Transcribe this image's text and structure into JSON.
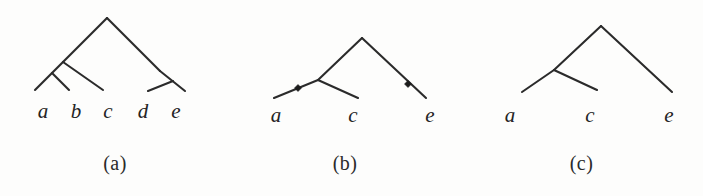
{
  "figure": {
    "background_color": "#fdfdfc",
    "line_color": "#2b2b2b",
    "marker_color": "#1c1c1c",
    "label_color": "#242424"
  },
  "panels": [
    {
      "id": "a",
      "caption": "(a)",
      "leaves": [
        {
          "label": "a",
          "x": 43,
          "y": 118
        },
        {
          "label": "b",
          "x": 76,
          "y": 118
        },
        {
          "label": "c",
          "x": 108,
          "y": 118
        },
        {
          "label": "d",
          "x": 143,
          "y": 118
        },
        {
          "label": "e",
          "x": 176,
          "y": 118
        }
      ],
      "edges": [
        {
          "name": "root-left",
          "x1": 107,
          "y1": 18,
          "x2": 63,
          "y2": 62
        },
        {
          "name": "root-right",
          "x1": 107,
          "y1": 18,
          "x2": 160,
          "y2": 71
        },
        {
          "name": "ab-stem",
          "x1": 63,
          "y1": 62,
          "x2": 35,
          "y2": 90
        },
        {
          "name": "b-branch",
          "x1": 52,
          "y1": 73,
          "x2": 69,
          "y2": 90
        },
        {
          "name": "c-branch",
          "x1": 63,
          "y1": 62,
          "x2": 103,
          "y2": 90
        },
        {
          "name": "de-stem",
          "x1": 160,
          "y1": 71,
          "x2": 185,
          "y2": 91
        },
        {
          "name": "d-branch",
          "x1": 173,
          "y1": 81,
          "x2": 148,
          "y2": 91
        }
      ],
      "markers": []
    },
    {
      "id": "b",
      "caption": "(b)",
      "leaves": [
        {
          "label": "a",
          "x": 46,
          "y": 122
        },
        {
          "label": "c",
          "x": 123,
          "y": 122
        },
        {
          "label": "e",
          "x": 200,
          "y": 122
        }
      ],
      "edges": [
        {
          "name": "root-left",
          "x1": 132,
          "y1": 38,
          "x2": 88,
          "y2": 80
        },
        {
          "name": "root-right",
          "x1": 132,
          "y1": 38,
          "x2": 196,
          "y2": 98
        },
        {
          "name": "a-branch",
          "x1": 88,
          "y1": 80,
          "x2": 44,
          "y2": 98
        },
        {
          "name": "c-branch",
          "x1": 88,
          "y1": 80,
          "x2": 128,
          "y2": 98
        }
      ],
      "markers": [
        {
          "name": "mutation-marker-a",
          "x": 68,
          "y": 88,
          "size": 7
        },
        {
          "name": "mutation-marker-e",
          "x": 178,
          "y": 84,
          "size": 7
        }
      ]
    },
    {
      "id": "c",
      "caption": "(c)",
      "leaves": [
        {
          "label": "a",
          "x": 50,
          "y": 122
        },
        {
          "label": "c",
          "x": 130,
          "y": 122
        },
        {
          "label": "e",
          "x": 209,
          "y": 122
        }
      ],
      "edges": [
        {
          "name": "root-left",
          "x1": 141,
          "y1": 26,
          "x2": 94,
          "y2": 70
        },
        {
          "name": "root-right",
          "x1": 141,
          "y1": 26,
          "x2": 212,
          "y2": 92
        },
        {
          "name": "a-branch",
          "x1": 94,
          "y1": 70,
          "x2": 62,
          "y2": 92
        },
        {
          "name": "c-branch",
          "x1": 94,
          "y1": 70,
          "x2": 137,
          "y2": 90
        }
      ],
      "markers": []
    }
  ]
}
